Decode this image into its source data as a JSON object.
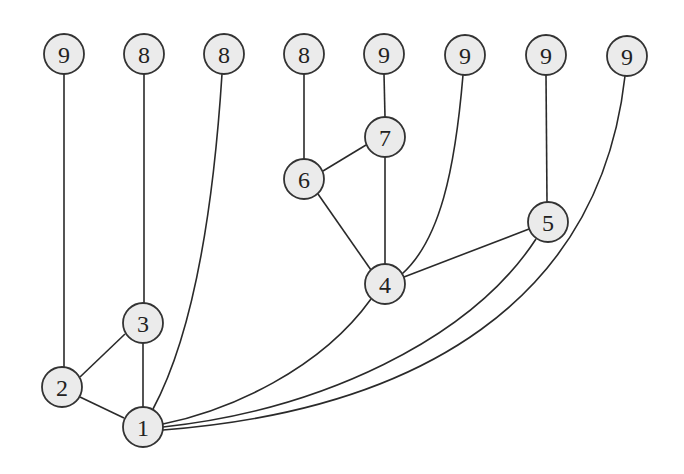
{
  "diagram": {
    "type": "graph",
    "style": {
      "node_fill": "#ebebeb",
      "node_stroke": "#333333",
      "edge_color": "#2a2a2a",
      "background": "#ffffff",
      "node_radius": 20
    },
    "nodes": [
      {
        "id": "t1",
        "label": "9",
        "x": 64,
        "y": 54
      },
      {
        "id": "t2",
        "label": "8",
        "x": 144,
        "y": 54
      },
      {
        "id": "t3",
        "label": "8",
        "x": 224,
        "y": 54
      },
      {
        "id": "t4",
        "label": "8",
        "x": 304,
        "y": 54
      },
      {
        "id": "t5",
        "label": "9",
        "x": 384,
        "y": 54
      },
      {
        "id": "t6",
        "label": "9",
        "x": 465,
        "y": 55
      },
      {
        "id": "t7",
        "label": "9",
        "x": 546,
        "y": 55
      },
      {
        "id": "t8",
        "label": "9",
        "x": 627,
        "y": 56
      },
      {
        "id": "n7",
        "label": "7",
        "x": 385,
        "y": 137
      },
      {
        "id": "n6",
        "label": "6",
        "x": 304,
        "y": 179
      },
      {
        "id": "n5",
        "label": "5",
        "x": 548,
        "y": 222
      },
      {
        "id": "n4",
        "label": "4",
        "x": 385,
        "y": 284
      },
      {
        "id": "n3",
        "label": "3",
        "x": 143,
        "y": 323
      },
      {
        "id": "n2",
        "label": "2",
        "x": 62,
        "y": 387
      },
      {
        "id": "n1",
        "label": "1",
        "x": 143,
        "y": 427
      }
    ],
    "edges": [
      {
        "from": "t1",
        "to": "n2",
        "path": "M64,74 L64,367"
      },
      {
        "from": "t2",
        "to": "n3",
        "path": "M144,74 L144,303"
      },
      {
        "from": "t3",
        "to": "n1",
        "path": "M222,74 C212,230 190,340 153,409"
      },
      {
        "from": "t4",
        "to": "n6",
        "path": "M304,74 L304,159"
      },
      {
        "from": "t5",
        "to": "n7",
        "path": "M384,74 L385,117"
      },
      {
        "from": "t6",
        "to": "n4",
        "path": "M463,75 C455,170 440,240 402,274"
      },
      {
        "from": "t7",
        "to": "n5",
        "path": "M546,75 L547,202"
      },
      {
        "from": "t8",
        "to": "n1",
        "path": "M625,76 C600,300 420,410 163,430"
      },
      {
        "from": "n7",
        "to": "n6",
        "path": "M366,145 L323,171"
      },
      {
        "from": "n7",
        "to": "n4",
        "path": "M385,157 L385,264"
      },
      {
        "from": "n6",
        "to": "n4",
        "path": "M318,194 L371,270"
      },
      {
        "from": "n5",
        "to": "n4",
        "path": "M529,229 L404,277"
      },
      {
        "from": "n4",
        "to": "n1",
        "path": "M371,299 C320,370 230,410 163,424"
      },
      {
        "from": "n5",
        "to": "n1",
        "path": "M536,239 C470,340 320,410 163,427"
      },
      {
        "from": "n3",
        "to": "n2",
        "path": "M125,334 L80,377"
      },
      {
        "from": "n3",
        "to": "n1",
        "path": "M143,343 L143,407"
      },
      {
        "from": "n2",
        "to": "n1",
        "path": "M80,397 L124,418"
      }
    ]
  }
}
